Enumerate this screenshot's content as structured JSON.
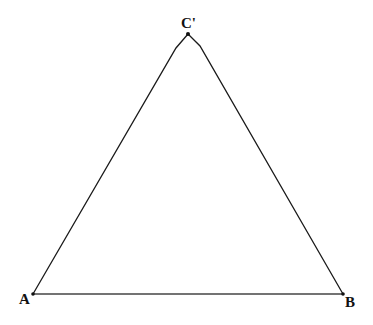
{
  "diagram": {
    "type": "triangle",
    "stroke_color": "#1a1a1a",
    "base_color": "#555555",
    "vertices": {
      "A": {
        "label": "A",
        "x": 33,
        "y": 294
      },
      "B": {
        "label": "B",
        "x": 343,
        "y": 294
      },
      "C": {
        "label": "C'",
        "x": 188,
        "y": 33
      }
    }
  }
}
